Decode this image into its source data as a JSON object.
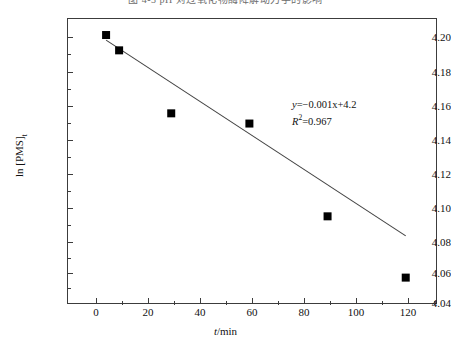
{
  "figure": {
    "title": "图 4-3  pH 对过氧化物酶降解动力学的影响",
    "background": "#ffffff",
    "frame_color": "#3c3c3c"
  },
  "annotation": {
    "equation_prefix": "y",
    "equation_body": "=−0.001x+4.2",
    "equation_var": "x",
    "r2_label": "R",
    "r2_sup": "2",
    "r2_value": "=0.967",
    "equation_full": "y=−0.001x+4.2",
    "r2_full": "R²=0.967"
  },
  "chart_data": {
    "type": "scatter",
    "title": "图 4-3  pH 对过氧化物酶降解动力学的影响",
    "xlabel": "t/min",
    "ylabel": "ln [PMS]t",
    "xlim": [
      -10,
      132
    ],
    "ylim": [
      4.04,
      4.208
    ],
    "grid": false,
    "legend": null,
    "marker": "filled-square",
    "marker_color": "#000000",
    "line_color": "#444444",
    "x": [
      5,
      10,
      30,
      60,
      90,
      120
    ],
    "y": [
      4.198,
      4.189,
      4.152,
      4.146,
      4.0915,
      4.0555
    ],
    "series": [
      {
        "name": "ln [PMS]t",
        "points": [
          {
            "x": 5,
            "y": 4.198
          },
          {
            "x": 10,
            "y": 4.189
          },
          {
            "x": 30,
            "y": 4.152
          },
          {
            "x": 60,
            "y": 4.146
          },
          {
            "x": 90,
            "y": 4.0915
          },
          {
            "x": 120,
            "y": 4.0555
          }
        ]
      }
    ],
    "fit_line": {
      "slope": -0.001,
      "intercept": 4.2,
      "r_squared": 0.967,
      "x_start": 5,
      "x_end": 120,
      "label": "y=−0.001x+4.2"
    },
    "x_ticks": [
      0,
      20,
      40,
      60,
      80,
      100,
      120
    ],
    "x_tick_labels": [
      "0",
      "20",
      "40",
      "60",
      "80",
      "100",
      "120"
    ],
    "x_minor_ticks": [
      10,
      30,
      50,
      70,
      90,
      110
    ],
    "y_ticks": [
      4.04,
      4.06,
      4.08,
      4.1,
      4.12,
      4.14,
      4.16,
      4.18,
      4.2
    ],
    "y_tick_labels": [
      "4.04",
      "4.06",
      "4.08",
      "4.10",
      "4.12",
      "4.14",
      "4.16",
      "4.18",
      "4.20"
    ],
    "y_minor_ticks": [
      4.05,
      4.07,
      4.09,
      4.11,
      4.13,
      4.15,
      4.17,
      4.19
    ]
  },
  "axes": {
    "y_title_main": "ln [PMS]",
    "y_title_sub": "t",
    "x_title_var": "t",
    "x_title_rest": "/min"
  }
}
